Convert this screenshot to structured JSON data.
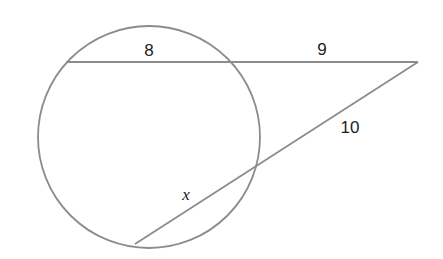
{
  "diagram": {
    "type": "secant-secant theorem",
    "colors": {
      "stroke": "#8c8c8c",
      "text": "#222222",
      "background": "#ffffff"
    },
    "circle": {
      "cx": 149,
      "cy": 137,
      "r": 111
    },
    "external_point": {
      "x": 418,
      "y": 62
    },
    "secant_top": {
      "inner_point": {
        "x": 66,
        "y": 62
      },
      "entry_point": {
        "x": 231,
        "y": 62
      },
      "internal_label": "8",
      "external_label": "9"
    },
    "secant_bottom": {
      "inner_point": {
        "x": 135,
        "y": 244
      },
      "entry_point": {
        "x": 260,
        "y": 165
      },
      "internal_label": "x",
      "external_label": "10"
    },
    "labels": [
      {
        "id": "top-internal",
        "text": "8",
        "x": 149,
        "y": 56
      },
      {
        "id": "top-external",
        "text": "9",
        "x": 322,
        "y": 55
      },
      {
        "id": "bottom-external",
        "text": "10",
        "x": 350,
        "y": 133
      },
      {
        "id": "bottom-internal",
        "text": "x",
        "x": 186,
        "y": 200
      }
    ]
  }
}
